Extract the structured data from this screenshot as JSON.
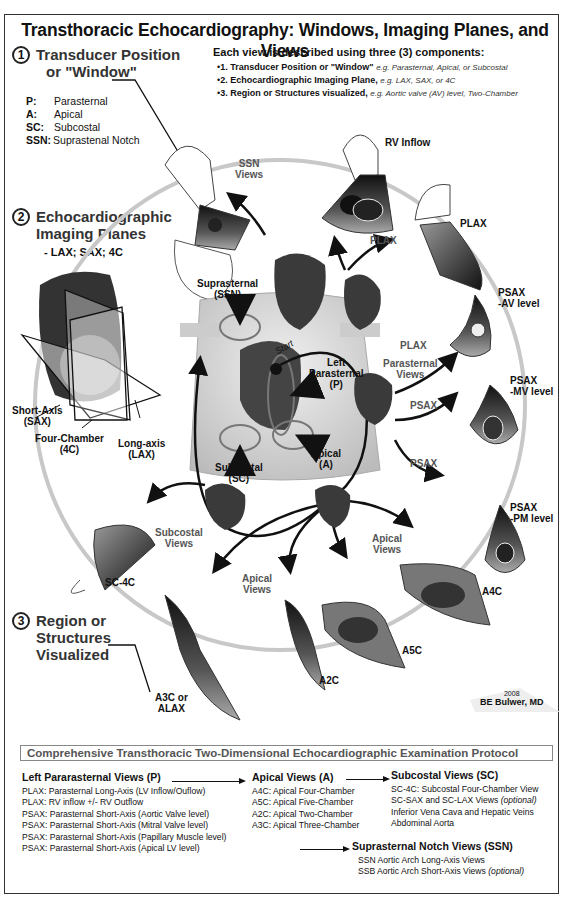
{
  "title": "Transthoracic Echocardiography: Windows, Imaging Planes, and Views",
  "components": {
    "heading": "Each view is described using three (3) components:",
    "items": [
      {
        "label": "1. Transducer Position or \"Window\"",
        "example": "e.g. Parasternal, Apical, or Subcostal"
      },
      {
        "label": "2. Echocardiographic Imaging Plane,",
        "example": "e.g. LAX, SAX, or 4C"
      },
      {
        "label": "3. Region or Structures visualized,",
        "example": "e.g. Aortic valve (AV) level, Two-Chamber"
      }
    ]
  },
  "sections": [
    {
      "num": "1",
      "title_line1": "Transducer Position",
      "title_line2": "or \"Window\""
    },
    {
      "num": "2",
      "title_line1": "Echocardiographic",
      "title_line2": "Imaging Planes",
      "sub": "- LAX; SAX; 4C"
    },
    {
      "num": "3",
      "title_line1": "Region or",
      "title_line2": "Structures",
      "title_line3": "Visualized"
    }
  ],
  "windows_legend": [
    {
      "abbr": "P",
      "name": "Parasternal"
    },
    {
      "abbr": "A",
      "name": "Apical"
    },
    {
      "abbr": "SC",
      "name": "Subcostal"
    },
    {
      "abbr": "SSN",
      "name": "Suprastenal Notch"
    }
  ],
  "planes": {
    "sax": [
      "Short-Axis",
      "(SAX)"
    ],
    "fourc": [
      "Four-Chamber",
      "(4C)"
    ],
    "lax": [
      "Long-axis",
      "(LAX)"
    ]
  },
  "windows_on_body": {
    "ssn": [
      "Suprasternal",
      "(SSN)"
    ],
    "parasternal": [
      "Left",
      "Parasternal",
      "(P)"
    ],
    "apical": [
      "Apical",
      "(A)"
    ],
    "subcostal": [
      "Subcostal",
      "(SC)"
    ],
    "start": "Start"
  },
  "view_groups": {
    "ssn": [
      "SSN",
      "Views"
    ],
    "parasternal": [
      "Parasternal",
      "Views"
    ],
    "subcostal": [
      "Subcostal",
      "Views"
    ],
    "apical_top": [
      "Apical",
      "Views"
    ],
    "apical_bottom": [
      "Apical",
      "Views"
    ]
  },
  "views": {
    "rv_inflow": "RV Inflow",
    "plax_arrow": "PLAX",
    "plax": "PLAX",
    "plax_heart": "PLAX",
    "psax_av": [
      "PSAX",
      "-AV level"
    ],
    "psax_mv": [
      "PSAX",
      "-MV level"
    ],
    "psax_pm": [
      "PSAX",
      "-PM level"
    ],
    "psax_arrow1": "PSAX",
    "psax_arrow2": "PSAX",
    "sc4c": "SC-4C",
    "a4c": "A4C",
    "a5c": "A5C",
    "a2c": "A2C",
    "a3c": [
      "A3C or",
      "ALAX"
    ]
  },
  "anatomy_labels": [
    "SVC",
    "RA",
    "RV",
    "LV",
    "LA",
    "Aorta",
    "PA",
    "LAA",
    "Ao"
  ],
  "signature": {
    "year": "2008",
    "author": "BE Bulwer, MD"
  },
  "protocol": {
    "title": "Comprehensive Transthoracic Two-Dimensional Echocardiographic Examination Protocol",
    "parasternal": {
      "head": "Left Pararasternal Views (",
      "abbr": "P",
      "close": ")",
      "items": [
        "PLAX: Parasternal Long-Axis (LV Inflow/Ouflow)",
        "PLAX: RV inflow +/- RV Outflow",
        "PSAX: Parasternal Short-Axis (Aortic Valve level)",
        "PSAX: Parasternal Short-Axis (Mitral Valve level)",
        "PSAX: Parasternal Short-Axis (Papillary Muscle level)",
        "PSAX: Parasternal Short-Axis  (Apical LV level)"
      ]
    },
    "apical": {
      "head": "Apical Views (",
      "abbr": "A",
      "close": ")",
      "items": [
        "A4C: Apical Four-Chamber",
        "A5C: Apical Five-Chamber",
        "A2C: Apical Two-Chamber",
        "A3C: Apical Three-Chamber"
      ]
    },
    "subcostal": {
      "head": "Subcostal Views (",
      "abbr": "SC",
      "close": ")",
      "items": [
        {
          "text": "SC-4C: Subcostal Four-Chamber View",
          "optional": ""
        },
        {
          "text": "SC-SAX and SC-LAX Views ",
          "optional": "(optional)"
        },
        {
          "text": "Inferior Vena Cava and Hepatic Veins",
          "optional": ""
        },
        {
          "text": "Abdominal Aorta",
          "optional": ""
        }
      ]
    },
    "ssn": {
      "head": "Suprasternal Notch Views (",
      "abbr": "SSN",
      "close": ")",
      "items": [
        {
          "text": "SSN Aortic Arch Long-Axis Views",
          "optional": ""
        },
        {
          "text": "SSB Aortic Arch Short-Axis Views ",
          "optional": "(optional)"
        }
      ]
    }
  },
  "colors": {
    "frame": "#333333",
    "text": "#111111",
    "grey_label": "#555555",
    "sector_dark": "#1a1a1a",
    "sector_mid": "#6b6b6b",
    "guide_circle": "#c8c8c8"
  }
}
